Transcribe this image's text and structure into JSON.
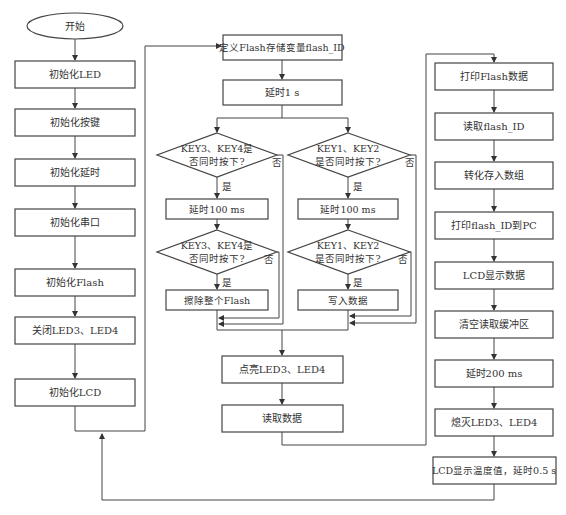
{
  "diagram": {
    "type": "flowchart",
    "start": "开始",
    "init_column": [
      "初始化LED",
      "初始化按键",
      "初始化延时",
      "初始化串口",
      "初始化Flash",
      "关闭LED3、LED4",
      "初始化LCD"
    ],
    "middle_column": {
      "define": "定义Flash存储变量flash_ID",
      "delay_1s": "延时1 s",
      "left_branch": {
        "decision1_line1": "KEY3、KEY4是",
        "decision1_line2": "否同时按下?",
        "delay": "延时100 ms",
        "decision2_line1": "KEY3、KEY4是",
        "decision2_line2": "否同时按下?",
        "action": "擦除整个Flash"
      },
      "right_branch": {
        "decision1_line1": "KEY1、KEY2",
        "decision1_line2": "是否同时按下?",
        "delay": "延时100 ms",
        "decision2_line1": "KEY1、KEY2",
        "decision2_line2": "是否同时按下?",
        "action": "写入数据"
      },
      "led_on": "点亮LED3、LED4",
      "read": "读取数据"
    },
    "right_column": [
      "打印Flash数据",
      "读取flash_ID",
      "转化存入数组",
      "打印flash_ID到PC",
      "LCD显示数据",
      "清空读取缓冲区",
      "延时200 ms",
      "熄灭LED3、LED4",
      "LCD显示温度值，延时0.5 s"
    ],
    "yes_label": "是",
    "no_label": "否"
  }
}
